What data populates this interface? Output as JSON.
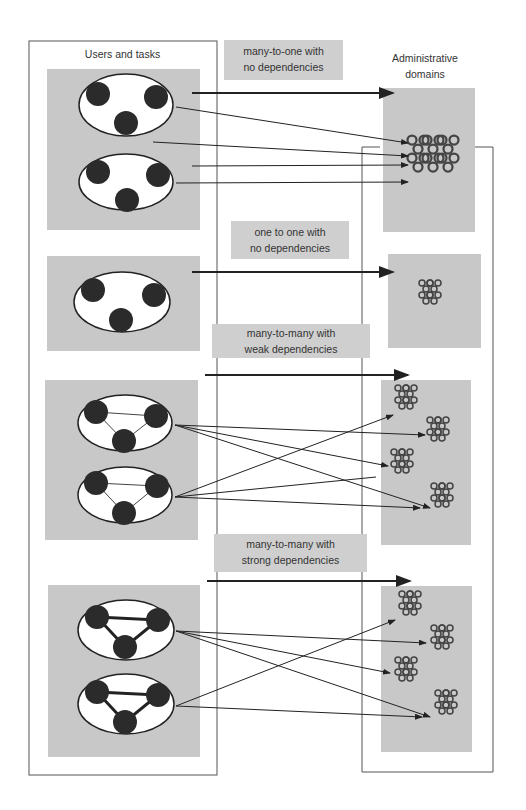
{
  "diagram": {
    "left_column": {
      "title": "Users and tasks"
    },
    "right_column": {
      "title_line1": "Administrative",
      "title_line2": "domains"
    },
    "mappings": [
      {
        "label_line1": "many-to-one with",
        "label_line2": "no dependencies"
      },
      {
        "label_line1": "one to one with",
        "label_line2": "no dependencies"
      },
      {
        "label_line1": "many-to-many with",
        "label_line2": "weak dependencies"
      },
      {
        "label_line1": "many-to-many  with",
        "label_line2": "strong dependencies"
      }
    ]
  },
  "colors": {
    "panel": "#c8c8c8",
    "node": "#2b2b2b",
    "line": "#333333",
    "tag": "#cfcfcf"
  }
}
